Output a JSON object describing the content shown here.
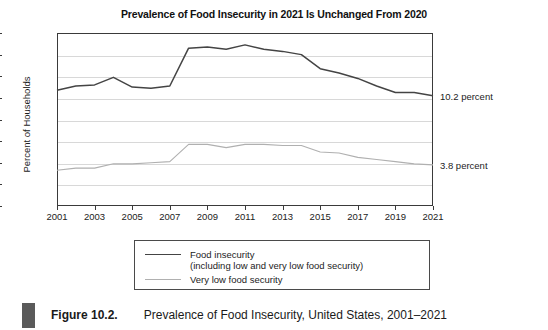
{
  "figure": {
    "caption_bar_color": "#5a5a5a",
    "caption_label": "Figure 10.2.",
    "caption_text": "Prevalence of Food Insecurity, United States, 2001–2021"
  },
  "annotations": {
    "food_insecurity_end": "10.2 percent",
    "very_low_end": "3.8 percent"
  },
  "legend": {
    "position": "below-plot",
    "series1_label": "Food insecurity",
    "series1_sublabel": "(including low and very low food security)",
    "series2_label": "Very low food security"
  },
  "chart_data": {
    "type": "line",
    "title": "Prevalence of Food Insecurity in 2021 Is Unchanged From 2020",
    "xlabel": "",
    "ylabel": "Percent of Households",
    "grid": true,
    "xlim": [
      2001,
      2021
    ],
    "ylim": [
      0,
      16
    ],
    "yticks": [
      0,
      2,
      4,
      6,
      8,
      10,
      12,
      14,
      16
    ],
    "xticks": [
      2001,
      2003,
      2005,
      2007,
      2009,
      2011,
      2013,
      2015,
      2017,
      2019,
      2021
    ],
    "x": [
      2001,
      2002,
      2003,
      2004,
      2005,
      2006,
      2007,
      2008,
      2009,
      2010,
      2011,
      2012,
      2013,
      2014,
      2015,
      2016,
      2017,
      2018,
      2019,
      2020,
      2021
    ],
    "series": [
      {
        "name": "Food insecurity (including low and very low food security)",
        "color": "#444444",
        "values": [
          10.7,
          11.1,
          11.2,
          11.9,
          11.0,
          10.9,
          11.1,
          14.6,
          14.7,
          14.5,
          14.9,
          14.5,
          14.3,
          14.0,
          12.7,
          12.3,
          11.8,
          11.1,
          10.5,
          10.5,
          10.2
        ]
      },
      {
        "name": "Very low food security",
        "color": "#b0b0b0",
        "values": [
          3.3,
          3.5,
          3.5,
          3.9,
          3.9,
          4.0,
          4.1,
          5.7,
          5.7,
          5.4,
          5.7,
          5.7,
          5.6,
          5.6,
          5.0,
          4.9,
          4.5,
          4.3,
          4.1,
          3.9,
          3.8
        ]
      }
    ]
  }
}
